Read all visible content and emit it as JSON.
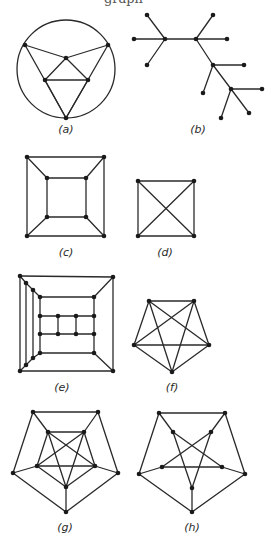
{
  "header": {
    "clipped_caption": "graph"
  },
  "style": {
    "edge_color": "#2a2a2a",
    "node_color": "#1a1a1a",
    "background": "#ffffff"
  },
  "graphs": [
    {
      "id": "a",
      "label": "(a)",
      "label_pos": [
        66,
        133
      ],
      "circle": {
        "cx": 66,
        "cy": 69,
        "r": 49
      },
      "nodes": [
        [
          25,
          45
        ],
        [
          108,
          45
        ],
        [
          66,
          58
        ],
        [
          45,
          80
        ],
        [
          88,
          80
        ],
        [
          66,
          118
        ]
      ],
      "edges": [
        [
          0,
          2
        ],
        [
          1,
          2
        ],
        [
          0,
          5
        ],
        [
          1,
          5
        ],
        [
          2,
          3
        ],
        [
          2,
          4
        ],
        [
          3,
          4
        ],
        [
          3,
          5
        ],
        [
          4,
          5
        ]
      ]
    },
    {
      "id": "b",
      "label": "(b)",
      "label_pos": [
        198,
        133
      ],
      "nodes": [
        [
          147,
          15
        ],
        [
          134,
          39
        ],
        [
          147,
          65
        ],
        [
          165,
          39
        ],
        [
          196,
          39
        ],
        [
          213,
          15
        ],
        [
          227,
          39
        ],
        [
          213,
          65
        ],
        [
          244,
          65
        ],
        [
          203,
          93
        ],
        [
          231,
          89
        ],
        [
          262,
          89
        ],
        [
          221,
          118
        ],
        [
          249,
          113
        ]
      ],
      "edges": [
        [
          0,
          3
        ],
        [
          1,
          3
        ],
        [
          2,
          3
        ],
        [
          3,
          4
        ],
        [
          4,
          5
        ],
        [
          4,
          6
        ],
        [
          4,
          7
        ],
        [
          7,
          8
        ],
        [
          7,
          9
        ],
        [
          7,
          10
        ],
        [
          10,
          11
        ],
        [
          10,
          12
        ],
        [
          10,
          13
        ]
      ]
    },
    {
      "id": "c",
      "label": "(c)",
      "label_pos": [
        66,
        256
      ],
      "nodes": [
        [
          27,
          157
        ],
        [
          104,
          157
        ],
        [
          27,
          236
        ],
        [
          104,
          236
        ],
        [
          47,
          178
        ],
        [
          86,
          178
        ],
        [
          47,
          217
        ],
        [
          86,
          217
        ]
      ],
      "edges": [
        [
          0,
          1
        ],
        [
          1,
          3
        ],
        [
          3,
          2
        ],
        [
          2,
          0
        ],
        [
          4,
          5
        ],
        [
          5,
          7
        ],
        [
          7,
          6
        ],
        [
          6,
          4
        ],
        [
          0,
          4
        ],
        [
          1,
          5
        ],
        [
          2,
          6
        ],
        [
          3,
          7
        ]
      ]
    },
    {
      "id": "d",
      "label": "(d)",
      "label_pos": [
        165,
        256
      ],
      "nodes": [
        [
          138,
          181
        ],
        [
          194,
          181
        ],
        [
          138,
          236
        ],
        [
          194,
          236
        ]
      ],
      "edges": [
        [
          0,
          1
        ],
        [
          1,
          3
        ],
        [
          3,
          2
        ],
        [
          2,
          0
        ],
        [
          0,
          3
        ],
        [
          1,
          2
        ]
      ]
    },
    {
      "id": "e",
      "label": "(e)",
      "label_pos": [
        62,
        391
      ],
      "nodes": [
        [
          20,
          276
        ],
        [
          113,
          277
        ],
        [
          20,
          371
        ],
        [
          113,
          371
        ],
        [
          26,
          283
        ],
        [
          33,
          290
        ],
        [
          40,
          297
        ],
        [
          94,
          297
        ],
        [
          26,
          365
        ],
        [
          33,
          358
        ],
        [
          40,
          353
        ],
        [
          94,
          353
        ],
        [
          40,
          316
        ],
        [
          58,
          316
        ],
        [
          76,
          316
        ],
        [
          94,
          316
        ],
        [
          40,
          334
        ],
        [
          58,
          334
        ],
        [
          76,
          334
        ],
        [
          94,
          334
        ]
      ],
      "edges": [
        [
          0,
          1
        ],
        [
          1,
          3
        ],
        [
          3,
          2
        ],
        [
          2,
          0
        ],
        [
          0,
          4
        ],
        [
          4,
          5
        ],
        [
          5,
          6
        ],
        [
          2,
          8
        ],
        [
          8,
          9
        ],
        [
          9,
          10
        ],
        [
          4,
          8
        ],
        [
          5,
          9
        ],
        [
          6,
          12
        ],
        [
          12,
          16
        ],
        [
          16,
          10
        ],
        [
          6,
          7
        ],
        [
          10,
          11
        ],
        [
          1,
          7
        ],
        [
          3,
          11
        ],
        [
          7,
          15
        ],
        [
          15,
          19
        ],
        [
          19,
          11
        ],
        [
          12,
          13
        ],
        [
          13,
          14
        ],
        [
          14,
          15
        ],
        [
          16,
          17
        ],
        [
          17,
          18
        ],
        [
          18,
          19
        ],
        [
          13,
          17
        ],
        [
          14,
          18
        ]
      ]
    },
    {
      "id": "f",
      "label": "(f)",
      "label_pos": [
        172,
        391
      ],
      "nodes": [
        [
          149,
          301
        ],
        [
          194,
          301
        ],
        [
          134,
          345
        ],
        [
          209,
          345
        ],
        [
          172,
          372
        ]
      ],
      "edges": [
        [
          0,
          1
        ],
        [
          0,
          2
        ],
        [
          0,
          3
        ],
        [
          0,
          4
        ],
        [
          1,
          2
        ],
        [
          1,
          3
        ],
        [
          1,
          4
        ],
        [
          2,
          3
        ],
        [
          2,
          4
        ],
        [
          3,
          4
        ]
      ]
    },
    {
      "id": "g",
      "label": "(g)",
      "label_pos": [
        65,
        531
      ],
      "nodes": [
        [
          33,
          412
        ],
        [
          98,
          412
        ],
        [
          13,
          473
        ],
        [
          118,
          473
        ],
        [
          66,
          512
        ],
        [
          48,
          432
        ],
        [
          84,
          432
        ],
        [
          37,
          466
        ],
        [
          95,
          466
        ],
        [
          66,
          487
        ]
      ],
      "edges": [
        [
          0,
          1
        ],
        [
          1,
          3
        ],
        [
          3,
          4
        ],
        [
          4,
          2
        ],
        [
          2,
          0
        ],
        [
          0,
          5
        ],
        [
          1,
          6
        ],
        [
          2,
          7
        ],
        [
          3,
          8
        ],
        [
          4,
          9
        ],
        [
          5,
          6
        ],
        [
          6,
          8
        ],
        [
          8,
          9
        ],
        [
          9,
          7
        ],
        [
          7,
          5
        ],
        [
          5,
          9
        ],
        [
          5,
          8
        ],
        [
          6,
          7
        ],
        [
          6,
          9
        ],
        [
          7,
          8
        ]
      ]
    },
    {
      "id": "h",
      "label": "(h)",
      "label_pos": [
        192,
        531
      ],
      "nodes": [
        [
          159,
          413
        ],
        [
          225,
          413
        ],
        [
          139,
          474
        ],
        [
          245,
          474
        ],
        [
          192,
          512
        ],
        [
          173,
          432
        ],
        [
          211,
          432
        ],
        [
          162,
          467
        ],
        [
          222,
          467
        ],
        [
          192,
          488
        ]
      ],
      "edges": [
        [
          0,
          1
        ],
        [
          1,
          3
        ],
        [
          3,
          4
        ],
        [
          4,
          2
        ],
        [
          2,
          0
        ],
        [
          0,
          5
        ],
        [
          1,
          6
        ],
        [
          2,
          7
        ],
        [
          3,
          8
        ],
        [
          4,
          9
        ],
        [
          5,
          9
        ],
        [
          5,
          8
        ],
        [
          6,
          7
        ],
        [
          6,
          9
        ],
        [
          7,
          8
        ]
      ]
    }
  ]
}
